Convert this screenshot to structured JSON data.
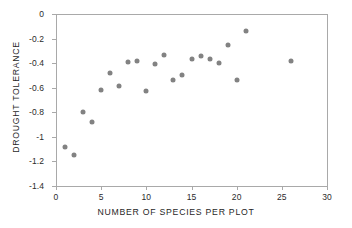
{
  "chart_data": {
    "type": "scatter",
    "title": "",
    "xlabel": "NUMBER OF SPECIES PER PLOT",
    "ylabel": "DROUGHT TOLERANCE",
    "xlim": [
      0,
      30
    ],
    "ylim": [
      -1.4,
      0
    ],
    "xticks": [
      0,
      5,
      10,
      15,
      20,
      25,
      30
    ],
    "xtick_labels": [
      "0",
      "5",
      "10",
      "15",
      "20",
      "25",
      "30"
    ],
    "yticks": [
      0,
      -0.2,
      -0.4,
      -0.6,
      -0.8,
      -1,
      -1.2,
      -1.4
    ],
    "ytick_labels": [
      "0",
      "-0.2",
      "-0.4",
      "-0.6",
      "-0.8",
      "-1",
      "-1.2",
      "-1.4"
    ],
    "grid": false,
    "legend": false,
    "marker": {
      "shape": "circle",
      "color": "#828282",
      "size_px": 5
    },
    "series": [
      {
        "name": "plots",
        "points": [
          {
            "x": 1,
            "y": -1.08
          },
          {
            "x": 2,
            "y": -1.15
          },
          {
            "x": 3,
            "y": -0.8
          },
          {
            "x": 4,
            "y": -0.88
          },
          {
            "x": 5,
            "y": -0.62
          },
          {
            "x": 6,
            "y": -0.48
          },
          {
            "x": 7,
            "y": -0.59
          },
          {
            "x": 8,
            "y": -0.39
          },
          {
            "x": 9,
            "y": -0.38
          },
          {
            "x": 10,
            "y": -0.63
          },
          {
            "x": 11,
            "y": -0.41
          },
          {
            "x": 12,
            "y": -0.33
          },
          {
            "x": 13,
            "y": -0.54
          },
          {
            "x": 14,
            "y": -0.5
          },
          {
            "x": 15,
            "y": -0.37
          },
          {
            "x": 16,
            "y": -0.34
          },
          {
            "x": 17,
            "y": -0.37
          },
          {
            "x": 18,
            "y": -0.4
          },
          {
            "x": 19,
            "y": -0.25
          },
          {
            "x": 20,
            "y": -0.54
          },
          {
            "x": 21,
            "y": -0.14
          },
          {
            "x": 26,
            "y": -0.38
          }
        ]
      }
    ]
  }
}
